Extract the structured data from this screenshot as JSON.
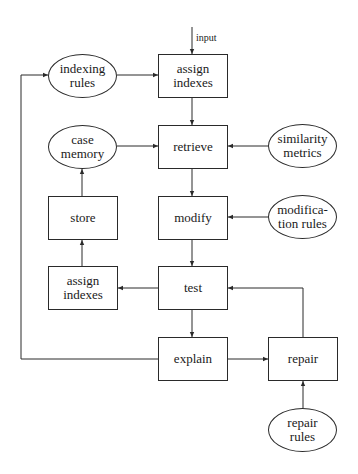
{
  "diagram": {
    "type": "flowchart",
    "input_label": "input",
    "nodes": {
      "indexing_rules": {
        "label": "indexing\nrules",
        "shape": "ellipse"
      },
      "assign_indexes_top": {
        "label": "assign\nindexes",
        "shape": "box"
      },
      "case_memory": {
        "label": "case\nmemory",
        "shape": "ellipse"
      },
      "retrieve": {
        "label": "retrieve",
        "shape": "box"
      },
      "similarity_metrics": {
        "label": "similarity\nmetrics",
        "shape": "ellipse"
      },
      "store": {
        "label": "store",
        "shape": "box"
      },
      "modify": {
        "label": "modify",
        "shape": "box"
      },
      "modification_rules": {
        "label": "modifica-\ntion rules",
        "shape": "ellipse"
      },
      "assign_indexes_bottom": {
        "label": "assign\nindexes",
        "shape": "box"
      },
      "test": {
        "label": "test",
        "shape": "box"
      },
      "explain": {
        "label": "explain",
        "shape": "box"
      },
      "repair": {
        "label": "repair",
        "shape": "box"
      },
      "repair_rules": {
        "label": "repair\nrules",
        "shape": "ellipse"
      }
    },
    "edges": [
      [
        "input",
        "assign_indexes_top"
      ],
      [
        "indexing_rules",
        "assign_indexes_top"
      ],
      [
        "assign_indexes_top",
        "retrieve"
      ],
      [
        "case_memory",
        "retrieve"
      ],
      [
        "similarity_metrics",
        "retrieve"
      ],
      [
        "retrieve",
        "modify"
      ],
      [
        "modification_rules",
        "modify"
      ],
      [
        "modify",
        "test"
      ],
      [
        "test",
        "assign_indexes_bottom"
      ],
      [
        "assign_indexes_bottom",
        "store"
      ],
      [
        "store",
        "case_memory"
      ],
      [
        "test",
        "explain"
      ],
      [
        "explain",
        "repair"
      ],
      [
        "explain",
        "indexing_rules"
      ],
      [
        "repair",
        "test"
      ],
      [
        "repair_rules",
        "repair"
      ]
    ],
    "caption": ""
  }
}
